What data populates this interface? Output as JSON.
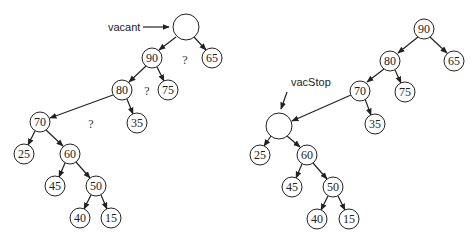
{
  "figure": {
    "left_tree": {
      "label": "vacant",
      "question_marks": [
        "?",
        "?",
        "?"
      ],
      "nodes": {
        "root": "",
        "n90": "90",
        "n65": "65",
        "n80": "80",
        "n75": "75",
        "n70": "70",
        "n35": "35",
        "n25": "25",
        "n60": "60",
        "n45": "45",
        "n50": "50",
        "n40": "40",
        "n15": "15"
      }
    },
    "right_tree": {
      "label": "vacStop",
      "nodes": {
        "n90": "90",
        "n80": "80",
        "n65": "65",
        "n70": "70",
        "n75": "75",
        "vac": "",
        "n35": "35",
        "n25": "25",
        "n60": "60",
        "n45": "45",
        "n50": "50",
        "n40": "40",
        "n15": "15"
      }
    }
  }
}
